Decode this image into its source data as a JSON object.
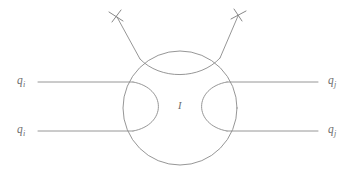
{
  "figure": {
    "type": "feynman-diagram",
    "background_color": "#ffffff",
    "line_color": "#8a8a8a"
  },
  "blob": {
    "label": "I",
    "center_x": 180,
    "center_y": 108,
    "radius": 57
  },
  "incoming_lines": [
    {
      "label_base": "q",
      "label_sub": "i",
      "y": 82,
      "name": "upper-incoming-quark"
    },
    {
      "label_base": "q",
      "label_sub": "i",
      "y": 131,
      "name": "lower-incoming-quark"
    }
  ],
  "outgoing_lines": [
    {
      "label_base": "q",
      "label_sub": "j",
      "y": 82,
      "name": "upper-outgoing-quark"
    },
    {
      "label_base": "q",
      "label_sub": "j",
      "y": 131,
      "name": "lower-outgoing-quark"
    }
  ],
  "emitted_lines": [
    {
      "marker": "cross",
      "name": "left-emitted-line",
      "tip_x": 116,
      "tip_y": 16
    },
    {
      "marker": "cross",
      "name": "right-emitted-line",
      "tip_x": 239,
      "tip_y": 15
    }
  ],
  "labels": {
    "upper_left": {
      "base": "q",
      "sub": "i"
    },
    "lower_left": {
      "base": "q",
      "sub": "i"
    },
    "upper_right": {
      "base": "q",
      "sub": "j"
    },
    "lower_right": {
      "base": "q",
      "sub": "j"
    },
    "center": "I"
  }
}
